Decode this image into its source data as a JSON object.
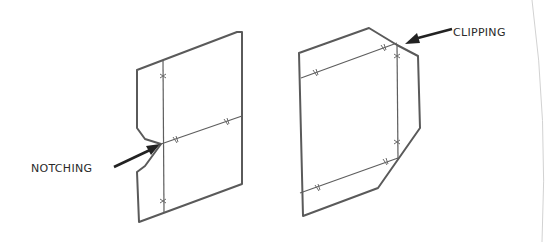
{
  "figure": {
    "type": "technical-line-drawing",
    "panels": [
      {
        "id": "notching",
        "label": "NOTCHING",
        "description": "Flat sheet pattern with a V-notch cut at the intersection of fold lines"
      },
      {
        "id": "clipping",
        "label": "CLIPPING",
        "description": "Flat sheet pattern with corners clipped at the fold line intersections"
      }
    ],
    "colors": {
      "line": "#5a5a5a",
      "text": "#2a2a2a",
      "background": "#ffffff"
    }
  }
}
